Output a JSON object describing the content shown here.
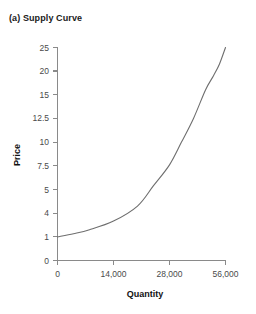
{
  "chart_data": {
    "type": "line",
    "title": "(a) Supply Curve",
    "xlabel": "Quantity",
    "ylabel": "Price",
    "grid": false,
    "legend": null,
    "legend_position": "none",
    "series_color": "#6e6e6e",
    "axis_color": "#8a8a8a",
    "x_tick_labels": [
      "0",
      "14,000",
      "28,000",
      "56,000"
    ],
    "x_tick_values": [
      0,
      14000,
      28000,
      56000
    ],
    "y_tick_labels": [
      "0",
      "1",
      "4",
      "5",
      "7.5",
      "10",
      "12.5",
      "15",
      "20",
      "25"
    ],
    "y_tick_values": [
      0,
      1,
      4,
      5,
      7.5,
      10,
      12.5,
      15,
      20,
      25
    ],
    "xlim": [
      0,
      56000
    ],
    "ylim": [
      0,
      25
    ],
    "note": "Axes use ordinal (evenly spaced) tick positions, not linear scaling.",
    "series": [
      {
        "name": "Supply",
        "x": [
          0,
          4000,
          8000,
          14000,
          20000,
          24000,
          28000,
          34000,
          40000,
          46000,
          50000,
          53000,
          56000
        ],
        "y": [
          1,
          1.4,
          1.9,
          3.0,
          4.3,
          5.4,
          7.6,
          10.0,
          12.5,
          16.0,
          19.0,
          21.5,
          25.0
        ]
      }
    ]
  }
}
